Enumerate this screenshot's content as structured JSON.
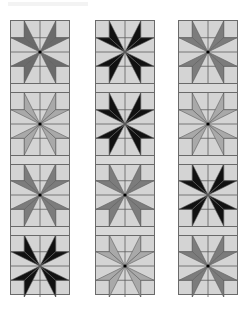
{
  "title": "",
  "palette": {
    "background": "#d4d4d4",
    "line": "#5e5e5e",
    "black": "#111111",
    "dark": "#6b6b6b",
    "mid": "#7c7c7c",
    "light": "#a9a9a9"
  },
  "columns": [
    {
      "name": "column-1",
      "x": 10,
      "blocks": [
        "dark",
        "light",
        "mid",
        "black"
      ]
    },
    {
      "name": "column-2",
      "x": 95,
      "blocks": [
        "black",
        "black",
        "mid",
        "light"
      ]
    },
    {
      "name": "column-3",
      "x": 178,
      "blocks": [
        "mid",
        "light",
        "black",
        "mid"
      ]
    }
  ],
  "layout": {
    "block_tops": [
      0,
      72,
      143,
      214
    ],
    "sash_tops": [
      62,
      134,
      205
    ]
  }
}
